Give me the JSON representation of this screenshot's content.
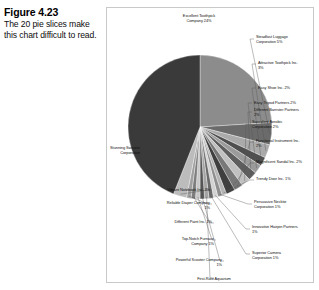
{
  "caption": {
    "title": "Figure 4.23",
    "text": "The 20 pie slices make this chart difficult to read."
  },
  "chart_data": {
    "type": "pie",
    "title": "",
    "grid": false,
    "legend_position": "callout-labels",
    "note": "Twenty grayscale pie slices with leader-line callout labels; slices ordered clockwise starting from the top.",
    "categories": [
      "Excellent Toothpick Company 24%",
      "Steadfast Luggage Corporation 5%",
      "Attractive Toothpick Inc. 3%",
      "Easy Shoe Inc. 2%",
      "Easy Tripod Partners 2%",
      "Different Barrister Partners 2%",
      "Succulent Aerobic Corporation 2%",
      "Functional Instrument Inc. 2%",
      "Magnificent Sandal Inc. 2%",
      "Trendy Door Inc. 1%",
      "Persuasive Necktie Corporation 1%",
      "Innovative Hairpin Partners 1%",
      "Superior Camera Corporation 1%",
      "First-Rate Aquarium",
      "Powerful Scooter Company 1%",
      "Top-Notch Furnace Company 1%",
      "Different Paint Inc. 1%",
      "Reliable Diaper Company 1%",
      "Vibrant Notebook Inc. 3%",
      "Stunning Sweater Corporation"
    ],
    "values": [
      24,
      5,
      3,
      2,
      2,
      2,
      2,
      2,
      2,
      1,
      1,
      1,
      1,
      1,
      1,
      1,
      1,
      1,
      3,
      44
    ],
    "colors": [
      "#8c8c8c",
      "#6b6b6b",
      "#aaaaaa",
      "#4f4f4f",
      "#9b9b9b",
      "#5e5e5e",
      "#c0c0c0",
      "#787878",
      "#3f3f3f",
      "#b4b4b4",
      "#8f8f8f",
      "#d2d2d2",
      "#696969",
      "#a4a4a4",
      "#555555",
      "#c8c8c8",
      "#7e7e7e",
      "#9f9f9f",
      "#bcbcbc",
      "#3a3a3a"
    ],
    "xlabel": "",
    "ylabel": ""
  },
  "labels": [
    {
      "key": "excellent-toothpick",
      "text": "Excellent Toothpick\nCompany 24%"
    },
    {
      "key": "steadfast-luggage",
      "text": "Steadfast Luggage\nCorporation 5%"
    },
    {
      "key": "attractive-toothpick",
      "text": "Attractive Toothpick Inc.\n3%"
    },
    {
      "key": "easy-shoe",
      "text": "Easy Shoe Inc. 2%"
    },
    {
      "key": "easy-tripod",
      "text": "Easy Tripod Partners 2%"
    },
    {
      "key": "different-barrister",
      "text": "Different Barrister Partners\n2%"
    },
    {
      "key": "succulent-aerobic",
      "text": "Succulent Aerobic\nCorporation 2%"
    },
    {
      "key": "functional-instrument",
      "text": "Functional Instrument Inc.\n2%"
    },
    {
      "key": "magnificent-sandal",
      "text": "Magnificent Sandal Inc. 2%"
    },
    {
      "key": "trendy-door",
      "text": "Trendy Door Inc. 1%"
    },
    {
      "key": "persuasive-necktie",
      "text": "Persuasive Necktie\nCorporation 1%"
    },
    {
      "key": "innovative-hairpin",
      "text": "Innovative Hairpin Partners\n1%"
    },
    {
      "key": "superior-camera",
      "text": "Superior Camera\nCorporation 1%"
    },
    {
      "key": "first-rate-aquarium",
      "text": "First-Rate Aquarium"
    },
    {
      "key": "powerful-scooter",
      "text": "Powerful Scooter Company\n1%"
    },
    {
      "key": "top-notch-furnace",
      "text": "Top-Notch Furnace\nCompany 1%"
    },
    {
      "key": "different-paint",
      "text": "Different Paint Inc. 1%"
    },
    {
      "key": "reliable-diaper",
      "text": "Reliable Diaper Company\n1%"
    },
    {
      "key": "vibrant-notebook",
      "text": "Vibrant Notebook Inc. 3%"
    },
    {
      "key": "stunning-sweater",
      "text": "Stunning Sweater\nCorporation"
    }
  ]
}
